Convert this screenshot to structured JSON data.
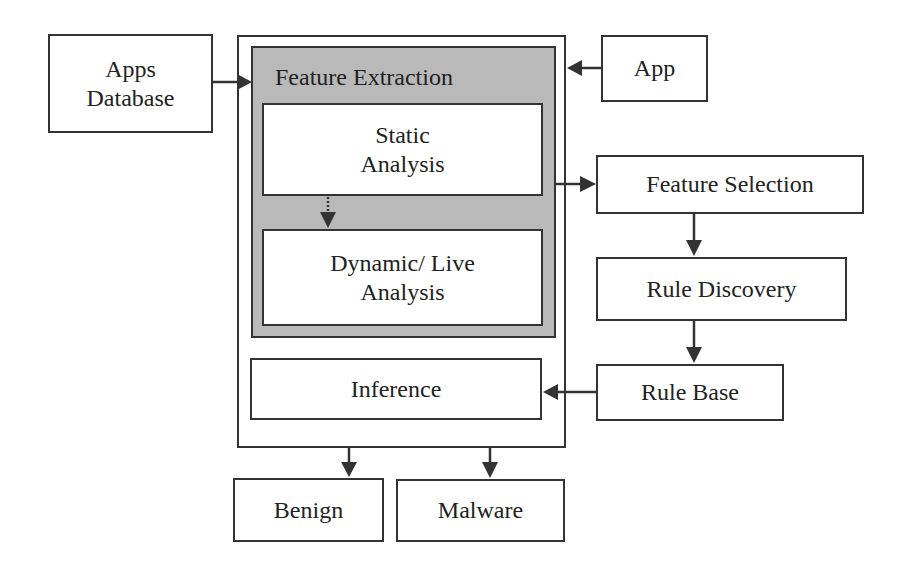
{
  "diagram": {
    "type": "flowchart",
    "nodes": {
      "apps_database": {
        "line1": "Apps",
        "line2": "Database"
      },
      "app": {
        "label": "App"
      },
      "feature_extraction": {
        "label": "Feature Extraction"
      },
      "static_analysis": {
        "line1": "Static",
        "line2": "Analysis"
      },
      "dynamic_analysis": {
        "line1": "Dynamic/ Live",
        "line2": "Analysis"
      },
      "inference": {
        "label": "Inference"
      },
      "feature_selection": {
        "label": "Feature Selection"
      },
      "rule_discovery": {
        "label": "Rule Discovery"
      },
      "rule_base": {
        "label": "Rule Base"
      },
      "benign": {
        "label": "Benign"
      },
      "malware": {
        "label": "Malware"
      }
    },
    "edges": [
      {
        "from": "Apps Database",
        "to": "Feature Extraction",
        "style": "solid"
      },
      {
        "from": "App",
        "to": "Feature Extraction",
        "style": "solid"
      },
      {
        "from": "Static Analysis",
        "to": "Dynamic/ Live Analysis",
        "style": "dotted"
      },
      {
        "from": "Feature Extraction",
        "to": "Feature Selection",
        "style": "solid"
      },
      {
        "from": "Feature Selection",
        "to": "Rule Discovery",
        "style": "solid"
      },
      {
        "from": "Rule Discovery",
        "to": "Rule Base",
        "style": "solid"
      },
      {
        "from": "Rule Base",
        "to": "Inference",
        "style": "solid"
      },
      {
        "from": "Inference",
        "to": "Benign",
        "style": "solid"
      },
      {
        "from": "Inference",
        "to": "Malware",
        "style": "solid"
      }
    ],
    "colors": {
      "stroke": "#333333",
      "shaded_fill": "#b9b9b9",
      "box_fill": "#ffffff"
    }
  }
}
